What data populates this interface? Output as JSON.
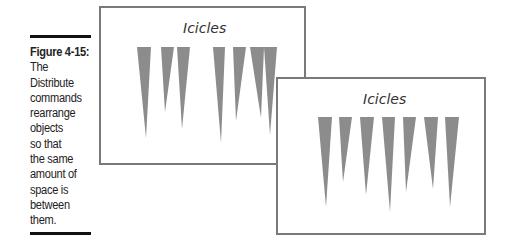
{
  "figure": {
    "label": "Figure 4-15:",
    "caption_lines": [
      "The",
      "Distribute",
      "commands",
      "rearrange",
      "objects",
      "so that",
      "the same",
      "amount of",
      "space is",
      "between",
      "them."
    ],
    "colors": {
      "rule": "#111111",
      "icicle": "#8c8c8c",
      "slide_border": "#7a7a7a"
    }
  },
  "slides": [
    {
      "name": "before",
      "title": "Icicles",
      "icicles": [
        {
          "left": 135,
          "right": 149,
          "tip_x": 144,
          "tip_y": 136
        },
        {
          "left": 159,
          "right": 172,
          "tip_x": 163,
          "tip_y": 110
        },
        {
          "left": 175,
          "right": 188,
          "tip_x": 180,
          "tip_y": 127
        },
        {
          "left": 211,
          "right": 223,
          "tip_x": 219,
          "tip_y": 141
        },
        {
          "left": 231,
          "right": 244,
          "tip_x": 234,
          "tip_y": 119
        },
        {
          "left": 248,
          "right": 262,
          "tip_x": 259,
          "tip_y": 116
        },
        {
          "left": 262,
          "right": 275,
          "tip_x": 268,
          "tip_y": 133
        }
      ]
    },
    {
      "name": "after",
      "title": "Icicles",
      "icicles": [
        {
          "left": 316,
          "right": 330,
          "tip_x": 324,
          "tip_y": 205
        },
        {
          "left": 337,
          "right": 350,
          "tip_x": 341,
          "tip_y": 180
        },
        {
          "left": 358,
          "right": 372,
          "tip_x": 364,
          "tip_y": 193
        },
        {
          "left": 380,
          "right": 393,
          "tip_x": 388,
          "tip_y": 210
        },
        {
          "left": 401,
          "right": 414,
          "tip_x": 404,
          "tip_y": 190
        },
        {
          "left": 422,
          "right": 436,
          "tip_x": 431,
          "tip_y": 187
        },
        {
          "left": 443,
          "right": 457,
          "tip_x": 448,
          "tip_y": 205
        }
      ]
    }
  ]
}
